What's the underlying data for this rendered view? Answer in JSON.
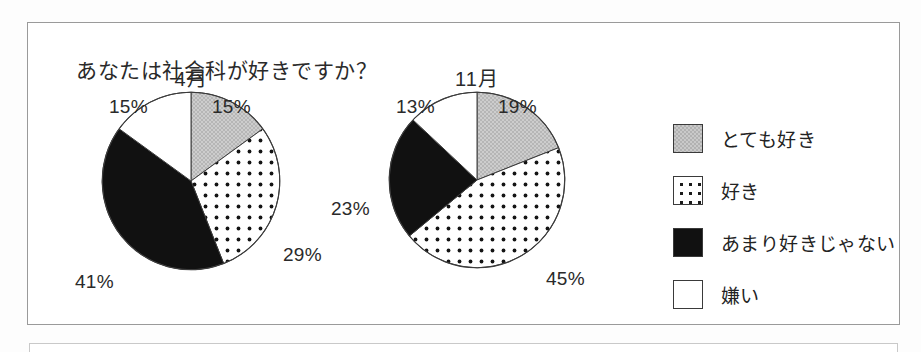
{
  "title": "あなたは社会科が好きですか？",
  "legend": {
    "items": [
      {
        "label": "とても好き",
        "pattern": "gray",
        "swatch_name": "legend-swatch-very-like"
      },
      {
        "label": "好き",
        "pattern": "dots",
        "swatch_name": "legend-swatch-like"
      },
      {
        "label": "あまり好きじゃない",
        "pattern": "black",
        "swatch_name": "legend-swatch-not-much"
      },
      {
        "label": "嫌い",
        "pattern": "white",
        "swatch_name": "legend-swatch-dislike"
      }
    ]
  },
  "charts": [
    {
      "caption": "4月",
      "labels": [
        "15%",
        "29%",
        "41%",
        "15%"
      ]
    },
    {
      "caption": "11月",
      "labels": [
        "19%",
        "45%",
        "23%",
        "13%"
      ]
    }
  ],
  "chart_data": [
    {
      "type": "pie",
      "title": "4月",
      "categories": [
        "とても好き",
        "好き",
        "あまり好きじゃない",
        "嫌い"
      ],
      "values": [
        15,
        29,
        41,
        15
      ],
      "value_labels": [
        "15%",
        "29%",
        "41%",
        "15%"
      ],
      "colors": [
        "#c9c9c9",
        "#ffffff",
        "#111111",
        "#ffffff"
      ],
      "patterns": [
        "gray-checker",
        "dots",
        "solid-black",
        "solid-white"
      ],
      "start_angle_deg": 0,
      "direction": "clockwise",
      "legend": [
        "とても好き",
        "好き",
        "あまり好きじゃない",
        "嫌い"
      ],
      "legend_position": "right",
      "grid": false,
      "xlabel": "",
      "ylabel": ""
    },
    {
      "type": "pie",
      "title": "11月",
      "categories": [
        "とても好き",
        "好き",
        "あまり好きじゃない",
        "嫌い"
      ],
      "values": [
        19,
        45,
        23,
        13
      ],
      "value_labels": [
        "19%",
        "45%",
        "23%",
        "13%"
      ],
      "colors": [
        "#c9c9c9",
        "#ffffff",
        "#111111",
        "#ffffff"
      ],
      "patterns": [
        "gray-checker",
        "dots",
        "solid-black",
        "solid-white"
      ],
      "start_angle_deg": 0,
      "direction": "clockwise",
      "legend": [
        "とても好き",
        "好き",
        "あまり好きじゃない",
        "嫌い"
      ],
      "legend_position": "right",
      "grid": false,
      "xlabel": "",
      "ylabel": ""
    }
  ]
}
